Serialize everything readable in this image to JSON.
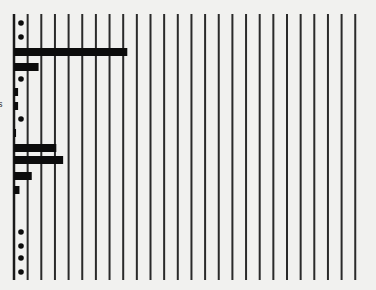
{
  "chart_data": {
    "type": "bar",
    "orientation": "horizontal",
    "title": "",
    "xlabel": "",
    "ylabel": "",
    "edge_label_fragment": "s",
    "grid": {
      "vertical": true,
      "horizontal": false,
      "line_count": 26
    },
    "xlim": [
      0,
      25
    ],
    "x_step": 1,
    "zero_marker": "dot",
    "categories": [
      "r1",
      "r2",
      "r3",
      "r4",
      "r5",
      "r6",
      "r7",
      "r8",
      "r9",
      "r10",
      "r11",
      "r12",
      "r13",
      "r14",
      "r15",
      "r16",
      "r17",
      "r18",
      "r19"
    ],
    "values": [
      0,
      0,
      8.3,
      1.8,
      0,
      0.3,
      0.3,
      0,
      0.15,
      3.1,
      3.6,
      1.3,
      0.4,
      null,
      null,
      0,
      0,
      0,
      0
    ],
    "colors": {
      "bar": "#0c0c0c",
      "grid": "#2a2a2a",
      "background": "#efefed"
    }
  },
  "layout": {
    "axis_x_px": 14,
    "px_per_unit": 13.65,
    "plot_top_px": 14,
    "plot_bottom_px": 280,
    "row_y_px": [
      23,
      37,
      52,
      67,
      79,
      92,
      106,
      119,
      133,
      148,
      160,
      176,
      190,
      205,
      218,
      232,
      246,
      258,
      272
    ],
    "bar_height_px": 8
  }
}
